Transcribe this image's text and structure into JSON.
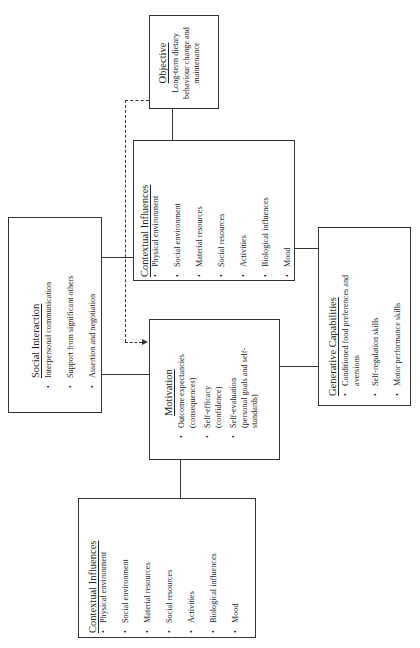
{
  "objective": {
    "title": "Objective",
    "lines": [
      "Long-term dietary",
      "behaviour change and",
      "maintenance"
    ]
  },
  "contextual_top": {
    "title": "Contextual Influences",
    "items": [
      "Physical environment",
      "Social environment",
      "Material resources",
      "Social resources",
      "Activities",
      "Biological influences",
      "Mood"
    ]
  },
  "social_interaction": {
    "title": "Social Interaction",
    "items": [
      "Interpersonal communication",
      "Support from significant others",
      "Assertion and negotiation"
    ]
  },
  "motivation": {
    "title": "Motivation",
    "items": [
      {
        "line1": "Outcome expectancies",
        "line2": "(consequences)"
      },
      {
        "line1": "Self-efficacy",
        "line2": "(confidence)"
      },
      {
        "line1": "Self-evaluation",
        "line2": "(personal goals and self-",
        "line3": "standards)"
      }
    ]
  },
  "generative": {
    "title": "Generative Capabilities",
    "items": [
      {
        "line1": "Conditioned food preferences and",
        "line2": "aversions"
      },
      {
        "line1": "Self-regulation skills"
      },
      {
        "line1": "Motor performance skills"
      }
    ]
  },
  "contextual_bottom": {
    "title": "Contextual Influences",
    "items": [
      "Physical environment",
      "Social environment",
      "Material resources",
      "Social resources",
      "Activities",
      "Biological influences",
      "Mood"
    ]
  },
  "bullet": "•"
}
